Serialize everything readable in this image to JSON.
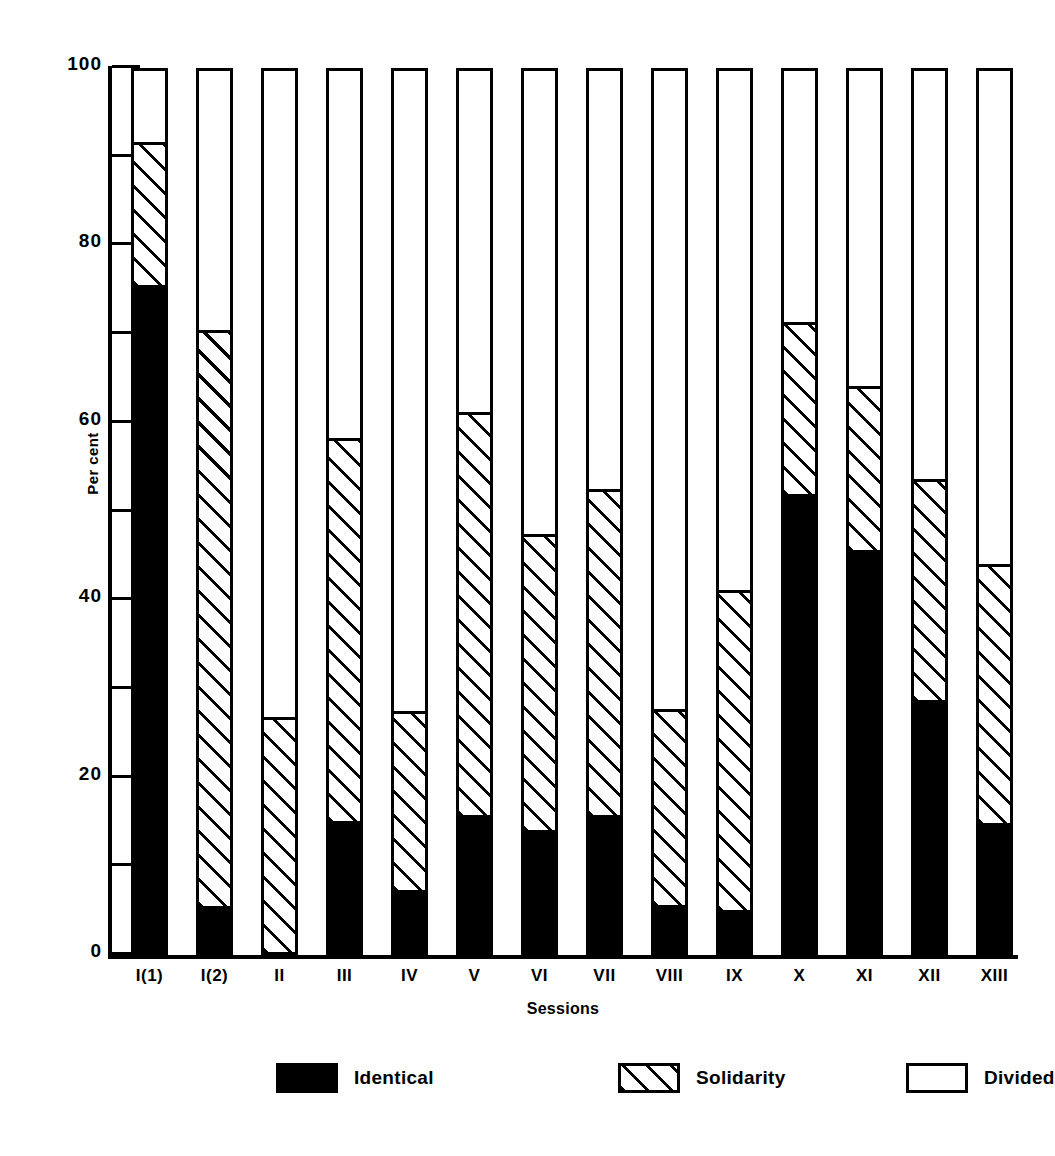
{
  "chart_data": {
    "type": "bar",
    "subtype": "stacked-100-percent",
    "title": "",
    "xlabel": "Sessions",
    "ylabel": "Per cent",
    "ylim": [
      0,
      100
    ],
    "grid": false,
    "legend_position": "bottom",
    "y_major_ticks": [
      100,
      80,
      60,
      40,
      20,
      0
    ],
    "y_minor_ticks": [
      90,
      70,
      50,
      30,
      10
    ],
    "y_tick_labels": [
      "100",
      "80",
      "60",
      "40",
      "20",
      "0"
    ],
    "categories": [
      "I(1)",
      "I(2)",
      "II",
      "III",
      "IV",
      "V",
      "VI",
      "VII",
      "VIII",
      "IX",
      "X",
      "XI",
      "XII",
      "XIII"
    ],
    "series": [
      {
        "name": "Identical",
        "pattern": "solid-black",
        "color": "#000000",
        "values": [
          75.2,
          5.2,
          0.0,
          14.8,
          7.0,
          15.5,
          13.8,
          15.4,
          5.3,
          4.7,
          51.6,
          45.3,
          28.4,
          14.5
        ]
      },
      {
        "name": "Solidarity",
        "pattern": "diagonal-hatch",
        "color": "#ffffff",
        "values": [
          16.1,
          64.9,
          26.5,
          43.1,
          20.2,
          45.4,
          33.3,
          36.8,
          22.1,
          36.1,
          19.4,
          18.5,
          24.9,
          29.2
        ]
      },
      {
        "name": "Divided",
        "pattern": "open-white",
        "color": "#ffffff",
        "values": [
          8.7,
          29.9,
          73.5,
          42.1,
          72.8,
          39.1,
          52.9,
          47.8,
          72.6,
          59.2,
          29.0,
          36.2,
          46.7,
          56.3
        ]
      }
    ],
    "cumulative_tops": {
      "identical": [
        75.2,
        5.2,
        0.0,
        14.8,
        7.0,
        15.5,
        13.8,
        15.4,
        5.3,
        4.7,
        51.6,
        45.3,
        28.4,
        14.5
      ],
      "solidarity": [
        91.3,
        70.1,
        26.5,
        57.9,
        27.2,
        60.9,
        47.1,
        52.2,
        27.4,
        40.8,
        71.0,
        63.8,
        53.3,
        43.7
      ],
      "divided": [
        100,
        100,
        100,
        100,
        100,
        100,
        100,
        100,
        100,
        100,
        100,
        100,
        100,
        100
      ]
    }
  },
  "axes": {
    "ylabel": "Per cent",
    "xlabel": "Sessions"
  },
  "legend": {
    "items": [
      {
        "label": "Identical",
        "swatch": "solid-black"
      },
      {
        "label": "Solidarity",
        "swatch": "diagonal-hatch"
      },
      {
        "label": "Divided",
        "swatch": "open-white"
      }
    ]
  },
  "colors": {
    "ink": "#000000",
    "paper": "#ffffff"
  }
}
